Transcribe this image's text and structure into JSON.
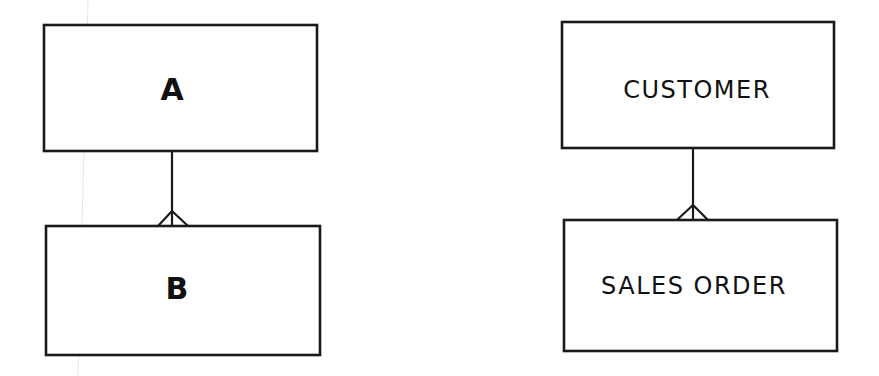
{
  "diagrams": [
    {
      "name": "generic",
      "parent": {
        "label": "A",
        "box": [
          44,
          25,
          273,
          126
        ]
      },
      "child": {
        "label": "B",
        "box": [
          46,
          226,
          274,
          129
        ]
      },
      "relationship": {
        "type": "one-to-many",
        "x": 172,
        "y1": 151,
        "y2": 226,
        "foot_left": 158,
        "foot_right": 188,
        "foot_apex": 211
      }
    },
    {
      "name": "example",
      "parent": {
        "label": "CUSTOMER",
        "box": [
          562,
          22,
          272,
          126
        ]
      },
      "child": {
        "label": "SALES ORDER",
        "box": [
          564,
          220,
          273,
          131
        ]
      },
      "relationship": {
        "type": "one-to-many",
        "x": 693,
        "y1": 148,
        "y2": 220,
        "foot_left": 677,
        "foot_right": 708,
        "foot_apex": 205
      }
    }
  ],
  "colors": {
    "line": "#1a1a1a",
    "background": "#ffffff"
  }
}
